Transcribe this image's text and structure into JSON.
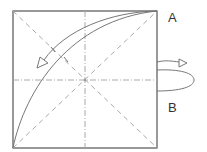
{
  "diagram": {
    "type": "origami-fold-diagram",
    "labels": {
      "a": "A",
      "b": "B"
    },
    "square": {
      "x": 13,
      "y": 11,
      "width": 144,
      "height": 137
    },
    "colors": {
      "outline": "#555555",
      "crease": "#aaaaaa",
      "arrow": "#777777"
    },
    "creases": [
      {
        "kind": "valley",
        "from": "top-left",
        "to": "bottom-right"
      },
      {
        "kind": "valley",
        "from": "bottom-left",
        "to": "top-right"
      },
      {
        "kind": "mountain",
        "orientation": "vertical",
        "position": "center"
      },
      {
        "kind": "mountain",
        "orientation": "horizontal",
        "position": "center"
      }
    ],
    "arrows": [
      {
        "kind": "fold",
        "description": "curved arrow from corner A toward left"
      },
      {
        "kind": "turn-over",
        "description": "loop arrow on right edge near B"
      }
    ]
  }
}
